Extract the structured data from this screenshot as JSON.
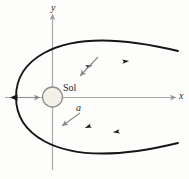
{
  "figure": {
    "background_color": "#fdfdfc",
    "axes": {
      "x_label": "x",
      "y_label": "y",
      "axis_color": "#a6a6a6",
      "x_axis_y": 97,
      "y_axis_x": 52,
      "x_axis_start": 4,
      "x_axis_end": 177,
      "y_axis_start": 14,
      "y_axis_end": 170
    },
    "central_body": {
      "name": "Sol",
      "label": "Sol",
      "center_x": 52,
      "center_y": 97,
      "radius": 10,
      "fill_color": "#f2efe6",
      "stroke_color": "#8f8f8f"
    },
    "parameter": {
      "label": "a",
      "description": "semi-major axis / periapsis distance marker",
      "leader_color": "#8a8a8a"
    },
    "trajectory": {
      "type": "hyperbola",
      "curve_color": "#1a1a1a",
      "vertex_x": 16,
      "vertex_y": 97,
      "direction": "outbound",
      "upper_branch_end_x": 178,
      "upper_branch_end_y": 51,
      "lower_branch_end_x": 178,
      "lower_branch_end_y": 146,
      "upper_arrow_marks": 2,
      "lower_arrow_marks": 2
    },
    "annotations": [
      {
        "name": "radius-pointer",
        "from": "Sol",
        "to": "upper branch"
      },
      {
        "name": "a-pointer",
        "from": "a",
        "to": "lower branch"
      },
      {
        "name": "focus-pointer",
        "from": "vertex",
        "to": "Sol"
      }
    ]
  }
}
